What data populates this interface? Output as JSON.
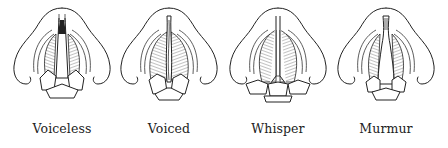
{
  "figure": {
    "panels": [
      {
        "id": "voiceless",
        "label": "Voiceless",
        "glottis": "open-triangle"
      },
      {
        "id": "voiced",
        "label": "Voiced",
        "glottis": "closed-vibrating"
      },
      {
        "id": "whisper",
        "label": "Whisper",
        "glottis": "narrow-posterior-gap"
      },
      {
        "id": "murmur",
        "label": "Murmur",
        "glottis": "partly-open-posterior"
      }
    ]
  },
  "colors": {
    "ink": "#222222",
    "background": "#ffffff"
  }
}
